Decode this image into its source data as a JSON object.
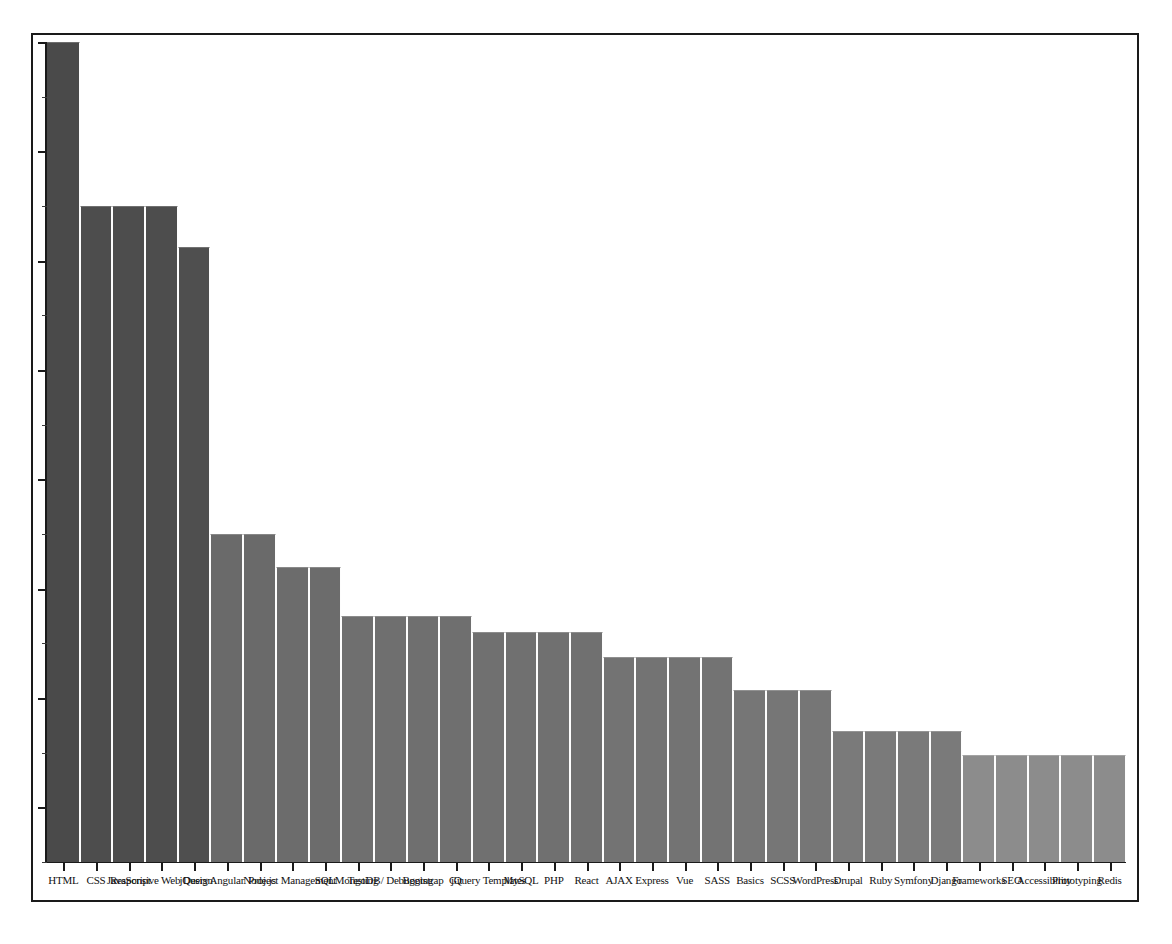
{
  "figure": {
    "background_color": "#ffffff",
    "frame_color": "#1a1a1a",
    "title": "",
    "xlabel": "",
    "ylabel": ""
  },
  "axis": {
    "y_tick_count": 16,
    "y_tick_labels": [],
    "x_tick_count": 33,
    "grid": false
  },
  "chart_data": {
    "type": "bar",
    "title": "",
    "subtitle": "",
    "xlabel": "",
    "ylabel": "",
    "legend": [],
    "legend_position": "none",
    "grid": false,
    "ylim": [
      0,
      100
    ],
    "xlim": [
      0,
      33
    ],
    "axis_tick_labels_y": [],
    "bar_edge_color": "#fdfdfd",
    "note": "Descending staircase bar chart of web technology mentions; x tick labels overlap heavily and are only partially legible.",
    "categories": [
      "HTML",
      "CSS",
      "JavaScript",
      "Responsive Web Design",
      "jQuery",
      "Angular",
      "Node.js",
      "Project Management",
      "SQL",
      "MongoDB",
      "Testing / Debugging",
      "Bootstrap",
      "Git",
      "jQuery Templates",
      "MySQL",
      "PHP",
      "React",
      "AJAX",
      "Express",
      "Vue",
      "SASS",
      "Basics",
      "SCSS",
      "WordPress",
      "Drupal",
      "Ruby",
      "Symfony",
      "Django",
      "Frameworks",
      "SEO",
      "Accessibility",
      "Prototyping",
      "Redis"
    ],
    "values": [
      100,
      80,
      80,
      80,
      75,
      40,
      40,
      36,
      36,
      30,
      30,
      30,
      30,
      28,
      28,
      28,
      28,
      25,
      25,
      25,
      25,
      21,
      21,
      21,
      16,
      16,
      16,
      16,
      13,
      13,
      13,
      13,
      13
    ],
    "bar_colors": [
      "#4a4a4a",
      "#4d4d4d",
      "#4d4d4d",
      "#4d4d4d",
      "#4f4f4f",
      "#6a6a6a",
      "#6a6a6a",
      "#6c6c6c",
      "#6c6c6c",
      "#6f6f6f",
      "#6f6f6f",
      "#6f6f6f",
      "#6f6f6f",
      "#707070",
      "#707070",
      "#707070",
      "#707070",
      "#737373",
      "#737373",
      "#737373",
      "#737373",
      "#767676",
      "#767676",
      "#767676",
      "#7a7a7a",
      "#7a7a7a",
      "#7a7a7a",
      "#7a7a7a",
      "#8c8c8c",
      "#8c8c8c",
      "#8c8c8c",
      "#8c8c8c",
      "#8c8c8c"
    ]
  }
}
